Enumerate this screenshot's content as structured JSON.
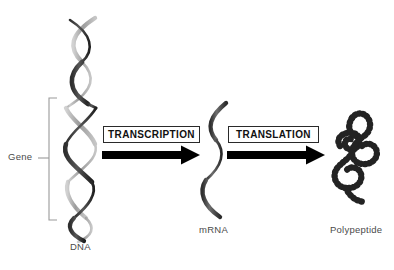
{
  "canvas": {
    "width": 394,
    "height": 270,
    "background": "#ffffff"
  },
  "header": {
    "clipped_text": "",
    "note": "row of text clipped off at top edge, illegible"
  },
  "diagram": {
    "stages": [
      {
        "id": "dna",
        "label": "DNA",
        "icon": "dna-double-helix-icon",
        "annotation": {
          "label": "Gene",
          "marker": "bracket"
        }
      },
      {
        "id": "mrna",
        "label": "mRNA",
        "icon": "mrna-single-strand-icon"
      },
      {
        "id": "polypeptide",
        "label": "Polypeptide",
        "icon": "polypeptide-bead-chain-icon"
      }
    ],
    "processes": [
      {
        "id": "transcription",
        "label": "TRANSCRIPTION",
        "from": "dna",
        "to": "mrna"
      },
      {
        "id": "translation",
        "label": "TRANSLATION",
        "from": "mrna",
        "to": "polypeptide"
      }
    ]
  },
  "colors": {
    "background": "#ffffff",
    "arrow": "#000000",
    "box_border": "#2a2a2a",
    "box_text": "#111111",
    "label_text": "#4a4a4a",
    "bracket": "#9a9a9a",
    "helix_dark": "#3b3b3b",
    "helix_light": "#b9b9b9",
    "polypeptide_bead": "#232323"
  }
}
